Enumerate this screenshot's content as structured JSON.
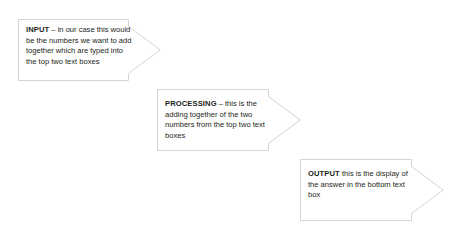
{
  "diagram": {
    "type": "process-flow",
    "background_color": "#ffffff",
    "stroke_color": "#d4d4d4",
    "text_color": "#231f20",
    "arrows": [
      {
        "id": "input",
        "keyword": "INPUT",
        "separator": " – ",
        "body": "in our case this would be the numbers we want to add together which are typed into the top two text boxes",
        "full_text": "INPUT – in our case this would be the numbers we want to add together which are typed into the top two text boxes"
      },
      {
        "id": "processing",
        "keyword": "PROCESSING",
        "separator": " – ",
        "body": "this is the adding together of the two numbers from the top two text boxes",
        "full_text": "PROCESSING – this is the adding together of the two numbers from the top two text boxes"
      },
      {
        "id": "output",
        "keyword": "OUTPUT",
        "separator": " ",
        "body": "this is the display of the answer in the bottom text box",
        "full_text": "OUTPUT this is the display of the answer in the bottom text box"
      }
    ]
  }
}
